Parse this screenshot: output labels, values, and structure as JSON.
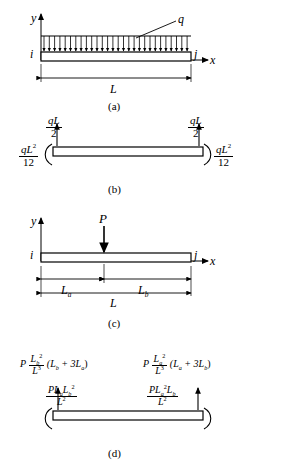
{
  "figure": {
    "title": "",
    "panels": [
      {
        "caption": "(a)",
        "axis_y": "y",
        "axis_x": "x",
        "node_i": "i",
        "node_j": "j",
        "load_label": "q",
        "span_label": "L",
        "description": "Simply supported beam with uniformly distributed load q over full span L"
      },
      {
        "caption": "(b)",
        "left_force_num": "qL",
        "left_force_den": "2",
        "right_force_num": "qL",
        "right_force_den": "2",
        "left_moment_num": "qL",
        "left_moment_num_exp": "2",
        "left_moment_den": "12",
        "right_moment_num": "qL",
        "right_moment_num_exp": "2",
        "right_moment_den": "12",
        "description": "Fixed-end forces and moments for uniform load"
      },
      {
        "caption": "(c)",
        "axis_y": "y",
        "axis_x": "x",
        "node_i": "i",
        "node_j": "j",
        "load_label": "P",
        "dim_a": "L",
        "dim_a_sub": "a",
        "dim_b": "L",
        "dim_b_sub": "b",
        "span_label": "L",
        "description": "Simply supported beam with point load P at distance L_a from left end"
      },
      {
        "caption": "(d)",
        "left_force": {
          "prefix": "P",
          "frac_num": "L",
          "frac_num_sub": "b",
          "frac_num_exp": "2",
          "frac_den": "L",
          "frac_den_exp": "3",
          "paren": "(L",
          "paren_sub": "b",
          "paren_mid": " + 3L",
          "paren_sub2": "a",
          "paren_end": ")"
        },
        "right_force": {
          "prefix": "P",
          "frac_num": "L",
          "frac_num_sub": "a",
          "frac_num_exp": "2",
          "frac_den": "L",
          "frac_den_exp": "3",
          "paren": "(L",
          "paren_sub": "a",
          "paren_mid": " + 3L",
          "paren_sub2": "b",
          "paren_end": ")"
        },
        "left_moment": {
          "num_prefix": "PL",
          "num_sub1": "a",
          "num_mid": "L",
          "num_sub2": "b",
          "num_exp": "2",
          "den": "L",
          "den_exp": "2"
        },
        "right_moment": {
          "num_prefix": "PL",
          "num_sub1": "a",
          "num_exp": "2",
          "num_mid": "L",
          "num_sub2": "b",
          "den": "L",
          "den_exp": "2"
        },
        "description": "Fixed-end forces and moments for point load"
      }
    ]
  }
}
